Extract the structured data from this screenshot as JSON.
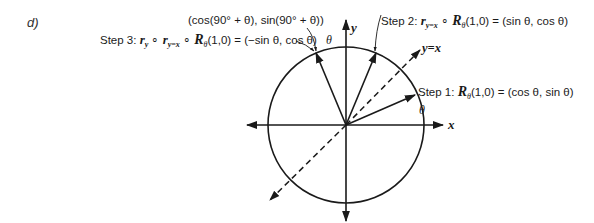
{
  "part_label": "d)",
  "axes": {
    "x_label": "x",
    "y_label": "y",
    "diagonal_label": "y=x"
  },
  "angle_symbol": "θ",
  "labels": {
    "top_point": "(cos(90° + θ), sin(90° + θ))",
    "step1": {
      "prefix": "Step 1: ",
      "op": "R",
      "sub": "θ",
      "args": "(1,0)",
      "result": " = (cos θ, sin θ)"
    },
    "step2": {
      "prefix": "Step 2: ",
      "r": "r",
      "r_sub": "y=x",
      "circ": " ∘ ",
      "op": "R",
      "sub": "θ",
      "args": "(1,0)",
      "result": " = (sin θ, cos θ)"
    },
    "step3": {
      "prefix": "Step 3: ",
      "r1": "r",
      "r1_sub": "y",
      "circ1": " ∘ ",
      "r2": "r",
      "r2_sub": "y=x",
      "circ2": " ∘ ",
      "op": "R",
      "sub": "θ",
      "args": "(1,0)",
      "result": " = (−sin θ, cos θ)"
    }
  },
  "geometry": {
    "center": [
      346,
      125
    ],
    "radius": 78,
    "theta_deg": 23
  }
}
